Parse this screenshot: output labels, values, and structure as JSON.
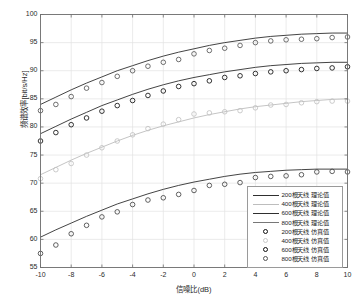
{
  "chart_data": {
    "type": "line",
    "title": "",
    "xlabel": "信噪比(dB)",
    "ylabel": "频谱效率[bit/s/Hz]",
    "xlim": [
      -10,
      10
    ],
    "ylim": [
      55,
      100
    ],
    "xticks": [
      "-10",
      "-8",
      "-6",
      "-4",
      "-2",
      "0",
      "2",
      "4",
      "6",
      "8",
      "10"
    ],
    "yticks": [
      "55",
      "60",
      "65",
      "70",
      "75",
      "80",
      "85",
      "90",
      "95",
      "100"
    ],
    "grid": true,
    "legend_position": "lower right",
    "x": [
      -10,
      -9,
      -8,
      -7,
      -6,
      -5,
      -4,
      -3,
      -2,
      -1,
      0,
      1,
      2,
      3,
      4,
      5,
      6,
      7,
      8,
      9,
      10
    ],
    "series": [
      {
        "name": "800根天线 理论值",
        "kind": "line",
        "color": "#2f2f2f",
        "values": [
          84.0,
          85.3,
          86.6,
          87.8,
          88.9,
          90.0,
          90.9,
          91.8,
          92.6,
          93.3,
          93.9,
          94.5,
          95.0,
          95.4,
          95.8,
          96.1,
          96.3,
          96.5,
          96.6,
          96.7,
          96.7
        ]
      },
      {
        "name": "600根天线 理论值",
        "kind": "line",
        "color": "#2f2f2f",
        "values": [
          78.8,
          80.1,
          81.4,
          82.6,
          83.8,
          84.8,
          85.8,
          86.7,
          87.5,
          88.2,
          88.8,
          89.3,
          89.8,
          90.2,
          90.6,
          90.9,
          91.1,
          91.3,
          91.4,
          91.5,
          91.5
        ]
      },
      {
        "name": "400根天线 理论值",
        "kind": "line",
        "color": "#bdbdbd",
        "values": [
          71.5,
          72.8,
          74.1,
          75.3,
          76.4,
          77.5,
          78.5,
          79.4,
          80.2,
          80.9,
          81.6,
          82.2,
          82.7,
          83.2,
          83.6,
          83.9,
          84.2,
          84.5,
          84.7,
          84.9,
          85.0
        ]
      },
      {
        "name": "200根天线 理论值",
        "kind": "line",
        "color": "#2f2f2f",
        "values": [
          60.4,
          61.7,
          62.9,
          64.1,
          65.2,
          66.3,
          67.2,
          68.1,
          68.9,
          69.6,
          70.2,
          70.7,
          71.2,
          71.6,
          71.9,
          72.1,
          72.3,
          72.4,
          72.5,
          72.5,
          72.5
        ]
      },
      {
        "name": "800根天线 仿真值",
        "kind": "markers",
        "color": "#555555",
        "values": [
          82.9,
          84.0,
          85.4,
          86.9,
          87.9,
          89.0,
          90.0,
          90.8,
          91.5,
          92.0,
          93.0,
          93.6,
          94.0,
          94.5,
          95.0,
          95.3,
          95.5,
          95.6,
          95.7,
          95.9,
          96.0
        ]
      },
      {
        "name": "600根天线 仿真值",
        "kind": "markers",
        "color": "#111111",
        "values": [
          77.5,
          79.0,
          80.4,
          81.6,
          82.8,
          83.8,
          84.7,
          85.6,
          86.4,
          87.2,
          87.7,
          88.2,
          88.8,
          89.1,
          89.5,
          89.8,
          90.0,
          90.2,
          90.4,
          90.5,
          90.7
        ]
      },
      {
        "name": "400根天线 仿真值",
        "kind": "markers",
        "color": "#c2c2c2",
        "values": [
          70.8,
          72.4,
          73.5,
          75.0,
          76.3,
          77.5,
          78.6,
          79.7,
          80.5,
          81.3,
          82.3,
          82.5,
          82.7,
          82.9,
          83.4,
          83.9,
          84.0,
          84.3,
          84.5,
          84.6,
          84.6
        ]
      },
      {
        "name": "200根天线 仿真值",
        "kind": "markers",
        "color": "#444444",
        "values": [
          57.5,
          59.0,
          61.0,
          62.5,
          64.0,
          64.9,
          66.2,
          67.0,
          67.4,
          68.0,
          68.7,
          69.6,
          69.8,
          70.1,
          71.0,
          71.2,
          71.3,
          71.5,
          72.0,
          72.1,
          72.0
        ]
      }
    ]
  },
  "legend": {
    "entries": [
      {
        "label": "200根天线 理论值",
        "type": "line",
        "color": "#2f2f2f"
      },
      {
        "label": "400根天线 理论值",
        "type": "line",
        "color": "#bdbdbd"
      },
      {
        "label": "600根天线 理论值",
        "type": "line",
        "color": "#2f2f2f"
      },
      {
        "label": "800根天线 理论值",
        "type": "line",
        "color": "#777777"
      },
      {
        "label": "200根天线 仿真值",
        "type": "marker",
        "color": "#111111"
      },
      {
        "label": "400根天线 仿真值",
        "type": "marker",
        "color": "#c9c9c9"
      },
      {
        "label": "600根天线 仿真值",
        "type": "marker",
        "color": "#111111"
      },
      {
        "label": "800根天线 仿真值",
        "type": "marker",
        "color": "#555555"
      }
    ]
  }
}
